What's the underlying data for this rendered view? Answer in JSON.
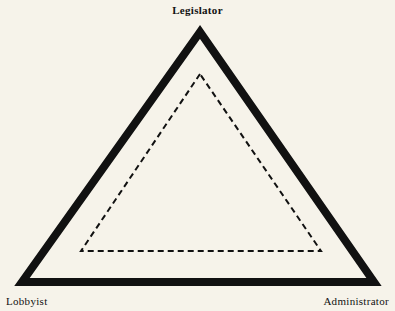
{
  "diagram": {
    "type": "iron-triangle",
    "nodes": {
      "top": {
        "label": "Legislator"
      },
      "bottom_left": {
        "label": "Lobbyist"
      },
      "bottom_right": {
        "label": "Administrator"
      }
    },
    "outer_triangle": {
      "style": "solid",
      "color": "#111111",
      "points": "200,32 22,282 374,282"
    },
    "inner_triangle": {
      "style": "dashed",
      "color": "#111111",
      "points": "200,74 81,251 321,251"
    },
    "background": "#f6f3ea"
  }
}
